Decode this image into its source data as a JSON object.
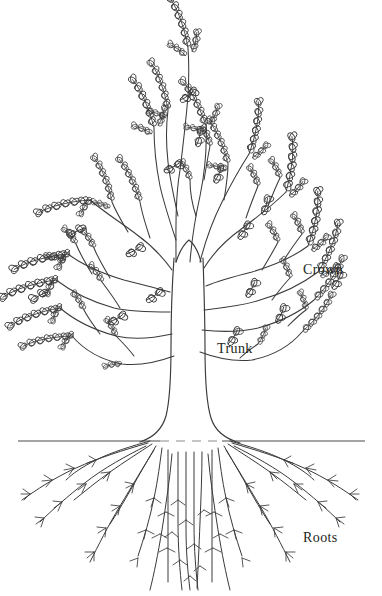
{
  "figure": {
    "background_color": "#ffffff",
    "ink_color": "#231f20",
    "line_color": "#3a3a3a",
    "ground_line_color": "#4a4a4a",
    "ground_dash_color": "#8c8c8c"
  },
  "labels": {
    "crown": "Crown",
    "trunk": "Trunk",
    "roots": "Roots"
  },
  "parts": [
    {
      "id": "crown",
      "label": "Crown",
      "description": "leafy branching canopy"
    },
    {
      "id": "trunk",
      "label": "Trunk",
      "description": "central vertical stem"
    },
    {
      "id": "roots",
      "label": "Roots",
      "description": "branching underground root system"
    }
  ],
  "ground": {
    "y": 441,
    "x_start": 18,
    "x_end": 365,
    "gap_start": 160,
    "gap_end": 222
  }
}
